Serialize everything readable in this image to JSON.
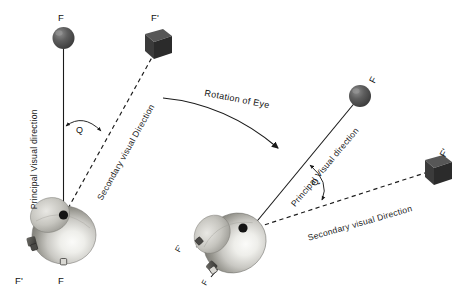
{
  "figure": {
    "type": "diagram",
    "background_color": "#ffffff",
    "ink_color": "#1a1a1a"
  },
  "left_diagram": {
    "name": "eye-primary-position",
    "targets": {
      "sphere_label": "F",
      "cube_label": "F'"
    },
    "lines": {
      "principal_label": "Principal Visual direction",
      "secondary_label": "Secondary visual Direction"
    },
    "angle_label": "Q",
    "retina_labels": {
      "fovea_label": "F",
      "peripheral_label": "F'"
    }
  },
  "right_diagram": {
    "name": "eye-rotated-position",
    "targets": {
      "sphere_label": "F",
      "cube_label": "F'"
    },
    "lines": {
      "principal_label": "Principal Visual direction",
      "secondary_label": "Secondary visual Direction"
    },
    "angle_label": "Q",
    "retina_labels": {
      "fovea_label": "F",
      "peripheral_label": "F'"
    }
  },
  "rotation_annotation": {
    "label": "Rotation of Eye"
  },
  "colors": {
    "sphere_dark": "#4a4a4a",
    "sphere_light": "#8f8f8f",
    "cube_dark": "#2e2e2e",
    "cube_light": "#5a5a5a",
    "globe_highlight": "#f2f2f0",
    "globe_mid": "#b9b8b4",
    "globe_shadow": "#6f6e6b",
    "line": "#1a1a1a"
  }
}
